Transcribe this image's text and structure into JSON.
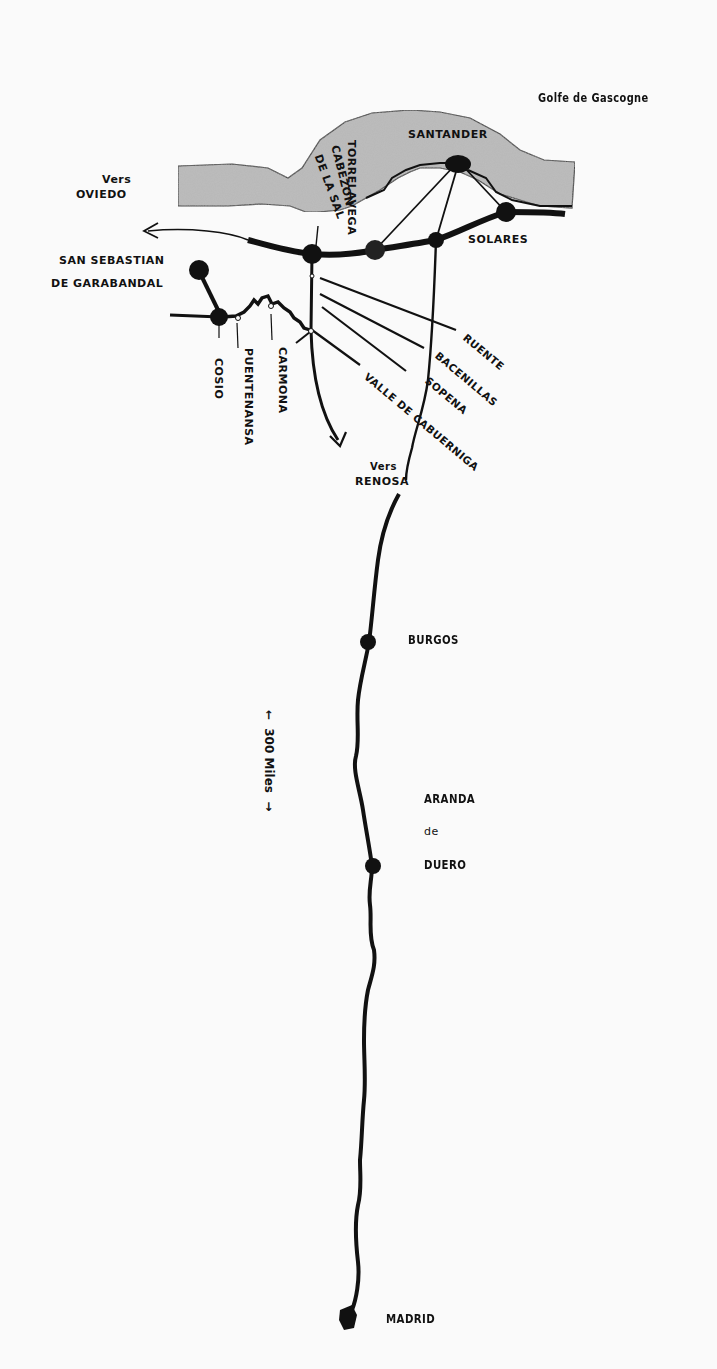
{
  "sea": {
    "label": "Golfe de Gascogne"
  },
  "directions": {
    "oviedo": {
      "prefix": "Vers",
      "city": "OVIEDO"
    },
    "renosa": {
      "prefix": "Vers",
      "city": "RENOSA"
    }
  },
  "places": {
    "santander": "SANTANDER",
    "torrelavega": "TORRELAVEGA",
    "cabezon": "CABEZON",
    "de_la_sal": "DE LA SAL",
    "solares": "SOLARES",
    "garabandal_line1": "SAN SEBASTIAN",
    "garabandal_line2": "DE GARABANDAL",
    "cosio": "COSIO",
    "puentenansa": "PUENTENANSA",
    "carmona": "CARMONA",
    "ruente": "RUENTE",
    "bacenillas": "BACENILLAS",
    "sopena": "SOPENA",
    "valle": "VALLE DE CABUERNIGA",
    "burgos": "BURGOS",
    "aranda_1": "ARANDA",
    "aranda_2": "de",
    "aranda_3": "DUERO",
    "madrid": "MADRID"
  },
  "scale": {
    "label": "300 Miles",
    "arrow_up": "←",
    "arrow_down": "→"
  },
  "colors": {
    "ink": "#111111",
    "land_shade": "#b8b8b8",
    "background": "#fafafa"
  }
}
